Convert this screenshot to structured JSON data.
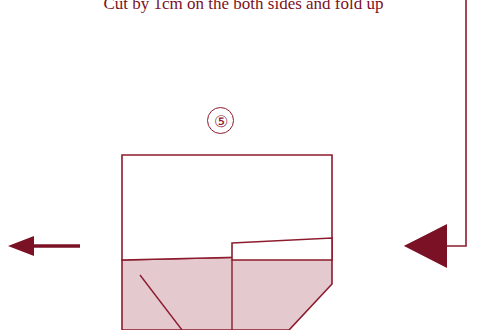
{
  "diagram": {
    "caption": "Cut by 1cm on the both sides and fold up",
    "step_number": "⑤",
    "colors": {
      "line": "#8d1b2d",
      "caption_text": "#7b1125",
      "fill_light": "#e4c9cf",
      "arrow": "#7b1125",
      "background": "#ffffff"
    },
    "labels": {
      "step_badge": "5",
      "left_arrow": "fold-direction-left",
      "right_arrow": "fold-direction-right"
    },
    "shapes": {
      "top_rectangle": "paper-top-panel",
      "lower_shaded": "paper-folded-flap",
      "cut_tab": "cut-tab-1cm",
      "crease_lines": "fold-crease-lines"
    }
  }
}
